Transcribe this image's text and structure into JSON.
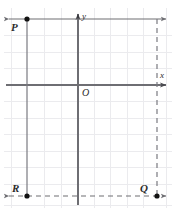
{
  "figure": {
    "background": "#ffffff",
    "width": 175,
    "height": 215,
    "colors": {
      "grid": "#e9e9ec",
      "grid_major": "#dcdce0",
      "axis": "#6e6e73",
      "construction": "#6e6e73",
      "dashed": "#6e6e73",
      "point": "#1a1a1a",
      "label": "#2b2b2b"
    },
    "grid": {
      "visible": true,
      "cell_size": 16.5,
      "x_lines": [
        11.5,
        28,
        44.5,
        61,
        77.5,
        94,
        110.5,
        127,
        143.5,
        160
      ],
      "y_lines": [
        19,
        35.5,
        52,
        68.5,
        85,
        101.5,
        118,
        134.5,
        151,
        167.5,
        184,
        196
      ]
    },
    "axes": {
      "x": {
        "label": "x",
        "y_pos": 85,
        "x_start": 6,
        "x_end": 169,
        "arrow": "right"
      },
      "y": {
        "label": "y",
        "x_pos": 78,
        "y_start": 12,
        "y_end": 205,
        "arrow": "up"
      },
      "origin_label": "O"
    },
    "points": [
      {
        "name": "P",
        "label": "P",
        "x": 27,
        "y": 19,
        "label_pos": "below-left"
      },
      {
        "name": "Q",
        "label": "Q",
        "x": 157,
        "y": 196,
        "label_pos": "above-left"
      },
      {
        "name": "R",
        "label": "R",
        "x": 27,
        "y": 196,
        "label_pos": "above-left"
      }
    ],
    "segments": [
      {
        "name": "top-line",
        "style": "solid",
        "orientation": "horizontal",
        "y": 19,
        "x1": 6,
        "x2": 169,
        "arrows": "both"
      },
      {
        "name": "left-line",
        "style": "solid",
        "orientation": "vertical",
        "x": 27,
        "y1": 19,
        "y2": 196,
        "arrows": "none"
      },
      {
        "name": "bottom-line",
        "style": "dashed",
        "orientation": "horizontal",
        "y": 196,
        "x1": 6,
        "x2": 169,
        "arrows": "both"
      },
      {
        "name": "right-line",
        "style": "dashed",
        "orientation": "vertical",
        "x": 157,
        "y1": 19,
        "y2": 196,
        "arrows": "none"
      }
    ]
  }
}
